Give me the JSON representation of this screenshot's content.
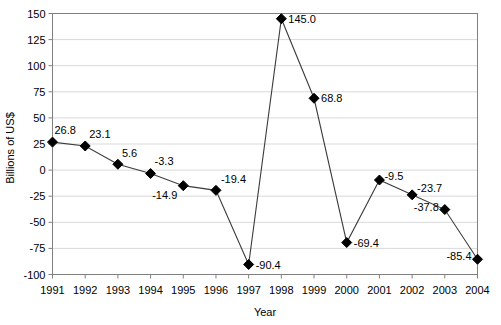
{
  "chart_data": {
    "type": "line",
    "title": "",
    "xlabel": "Year",
    "ylabel": "Billions of US$",
    "categories": [
      "1991",
      "1992",
      "1993",
      "1994",
      "1995",
      "1996",
      "1997",
      "1998",
      "1999",
      "2000",
      "2001",
      "2002",
      "2003",
      "2004"
    ],
    "values": [
      26.8,
      23.1,
      5.6,
      -3.3,
      -14.9,
      -19.4,
      -90.4,
      145.0,
      68.8,
      -69.4,
      -9.5,
      -23.7,
      -37.8,
      -85.4
    ],
    "data_labels": [
      "26.8",
      "23.1",
      "5.6",
      "-3.3",
      "-14.9",
      "-19.4",
      "-90.4",
      "145.0",
      "68.8",
      "-69.4",
      "-9.5",
      "-23.7",
      "-37.8",
      "-85.4"
    ],
    "ylim": [
      -100,
      150
    ],
    "yticks": [
      150,
      125,
      100,
      75,
      50,
      25,
      0,
      -25,
      -50,
      -75,
      -100
    ],
    "ytick_labels": [
      "150",
      "125",
      "100",
      "75",
      "50",
      "25",
      "0",
      "-25",
      "-50",
      "-75",
      "-100"
    ],
    "xtick_labels": [
      "1991",
      "1992",
      "1993",
      "1994",
      "1995",
      "1996",
      "1997",
      "1998",
      "1999",
      "2000",
      "2001",
      "2002",
      "2003",
      "2004"
    ],
    "grid": true,
    "grid_axis": "y",
    "legend": false,
    "series_name": "",
    "marker": "diamond",
    "marker_color": "#000000",
    "line_color": "#3c3c3c",
    "grid_color": "#d9d9d9",
    "axis_color": "#808080",
    "label_placements": [
      {
        "year": "1991",
        "value": 26.8,
        "dx": 2,
        "dy": -8,
        "anchor": "start"
      },
      {
        "year": "1992",
        "value": 23.1,
        "dx": 4,
        "dy": -8,
        "anchor": "start"
      },
      {
        "year": "1993",
        "value": 5.6,
        "dx": 4,
        "dy": -7,
        "anchor": "start"
      },
      {
        "year": "1994",
        "value": -3.3,
        "dx": 4,
        "dy": -9,
        "anchor": "start"
      },
      {
        "year": "1995",
        "value": -14.9,
        "dx": -6,
        "dy": 13,
        "anchor": "end"
      },
      {
        "year": "1996",
        "value": -19.4,
        "dx": 5,
        "dy": -7,
        "anchor": "start"
      },
      {
        "year": "1997",
        "value": -90.4,
        "dx": 7,
        "dy": 5,
        "anchor": "start"
      },
      {
        "year": "1998",
        "value": 145.0,
        "dx": 7,
        "dy": 4,
        "anchor": "start"
      },
      {
        "year": "1999",
        "value": 68.8,
        "dx": 7,
        "dy": 4,
        "anchor": "start"
      },
      {
        "year": "2000",
        "value": -69.4,
        "dx": 7,
        "dy": 4,
        "anchor": "start"
      },
      {
        "year": "2001",
        "value": -9.5,
        "dx": 5,
        "dy": 0,
        "anchor": "start"
      },
      {
        "year": "2002",
        "value": -23.7,
        "dx": 5,
        "dy": -3,
        "anchor": "start"
      },
      {
        "year": "2003",
        "value": -37.8,
        "dx": -6,
        "dy": 1,
        "anchor": "end"
      },
      {
        "year": "2004",
        "value": -85.4,
        "dx": -6,
        "dy": 1,
        "anchor": "end"
      }
    ]
  }
}
